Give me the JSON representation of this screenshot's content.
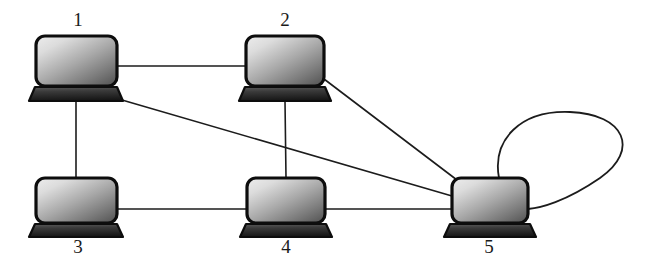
{
  "diagram": {
    "type": "undirected-graph-with-self-loop",
    "canvas": {
      "width": 646,
      "height": 272
    },
    "background_color": "#ffffff",
    "line_color": "#1c1c1c",
    "label_color": "#1a1a1a",
    "node_icon_name": "laptop-icon",
    "screen_gradient": {
      "from": "#e6e6e6",
      "to": "#5d5d5d"
    },
    "base_gradient": {
      "from": "#4a4a4a",
      "to": "#1a1a1a"
    },
    "nodes": [
      {
        "id": "1",
        "label": "1",
        "label_position": "above",
        "label_x": 78,
        "label_y": 26,
        "screen": {
          "x": 36,
          "y": 36,
          "width": 81,
          "height": 50,
          "rx": 9
        },
        "base": {
          "cx": 76,
          "top_y": 87,
          "top_half_width": 41,
          "bottom_y": 101,
          "bottom_half_width": 47
        }
      },
      {
        "id": "2",
        "label": "2",
        "label_position": "above",
        "label_x": 285,
        "label_y": 26,
        "screen": {
          "x": 246,
          "y": 36,
          "width": 78,
          "height": 50,
          "rx": 9
        },
        "base": {
          "cx": 285,
          "top_y": 87,
          "top_half_width": 40,
          "bottom_y": 101,
          "bottom_half_width": 46
        }
      },
      {
        "id": "3",
        "label": "3",
        "label_position": "below",
        "label_x": 78,
        "label_y": 253,
        "screen": {
          "x": 36,
          "y": 178,
          "width": 81,
          "height": 45,
          "rx": 9
        },
        "base": {
          "cx": 76,
          "top_y": 224,
          "top_half_width": 41,
          "bottom_y": 237,
          "bottom_half_width": 47
        }
      },
      {
        "id": "4",
        "label": "4",
        "label_position": "below",
        "label_x": 286,
        "label_y": 253,
        "screen": {
          "x": 247,
          "y": 178,
          "width": 78,
          "height": 45,
          "rx": 9
        },
        "base": {
          "cx": 286,
          "top_y": 224,
          "top_half_width": 40,
          "bottom_y": 237,
          "bottom_half_width": 46
        }
      },
      {
        "id": "5",
        "label": "5",
        "label_position": "below",
        "label_x": 489,
        "label_y": 253,
        "screen": {
          "x": 452,
          "y": 178,
          "width": 76,
          "height": 45,
          "rx": 9
        },
        "base": {
          "cx": 490,
          "top_y": 224,
          "top_half_width": 40,
          "bottom_y": 237,
          "bottom_half_width": 46
        }
      }
    ],
    "edges": [
      {
        "name": "edge-1-2",
        "from": "1",
        "to": "2",
        "kind": "straight",
        "x1": 117,
        "y1": 66,
        "x2": 246,
        "y2": 66
      },
      {
        "name": "edge-1-3",
        "from": "1",
        "to": "3",
        "kind": "straight",
        "x1": 76,
        "y1": 101,
        "x2": 76,
        "y2": 178
      },
      {
        "name": "edge-1-5",
        "from": "1",
        "to": "5",
        "kind": "straight",
        "x1": 122,
        "y1": 100,
        "x2": 452,
        "y2": 196
      },
      {
        "name": "edge-2-4",
        "from": "2",
        "to": "4",
        "kind": "straight",
        "x1": 285,
        "y1": 101,
        "x2": 286,
        "y2": 178
      },
      {
        "name": "edge-2-5",
        "from": "2",
        "to": "5",
        "kind": "straight",
        "x1": 324,
        "y1": 79,
        "x2": 457,
        "y2": 180
      },
      {
        "name": "edge-3-4",
        "from": "3",
        "to": "4",
        "kind": "straight",
        "x1": 117,
        "y1": 209,
        "x2": 247,
        "y2": 209
      },
      {
        "name": "edge-4-5",
        "from": "4",
        "to": "5",
        "kind": "straight",
        "x1": 325,
        "y1": 209,
        "x2": 452,
        "y2": 209
      },
      {
        "name": "edge-5-5-self-loop",
        "from": "5",
        "to": "5",
        "kind": "self-loop",
        "path": "M 499 178 C 492 140 520 110 570 112 C 625 114 640 150 600 178 C 565 202 540 208 528 209"
      }
    ]
  }
}
